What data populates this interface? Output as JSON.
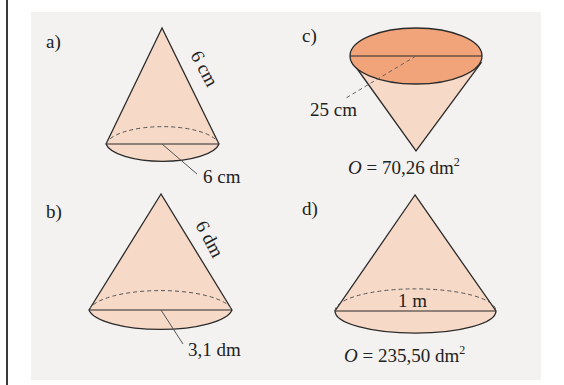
{
  "figures": [
    {
      "id": "a",
      "label": "a)",
      "slant": "6 cm",
      "diameter": "6 cm"
    },
    {
      "id": "b",
      "label": "b)",
      "slant": "6 dm",
      "radius": "3,1 dm"
    },
    {
      "id": "c",
      "label": "c)",
      "radius": "25 cm",
      "surface": {
        "var": "O",
        "eq": " = 70,26 dm",
        "sup": "2"
      }
    },
    {
      "id": "d",
      "label": "d)",
      "diameter": "1 m",
      "surface": {
        "var": "O",
        "eq": " = 235,50 dm",
        "sup": "2"
      }
    }
  ],
  "colors": {
    "cone_fill": "#f6d9c7",
    "base_fill_c": "#f1a37a",
    "stroke": "#2b2b2b",
    "panel": "#f3f2f0"
  }
}
